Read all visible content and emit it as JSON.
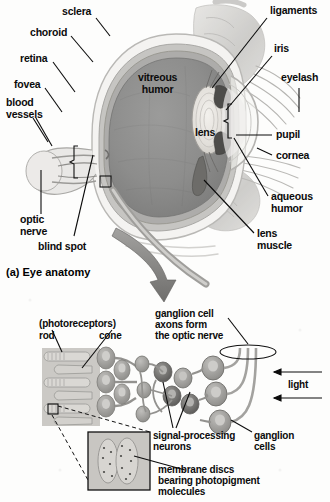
{
  "figure": {
    "caption_a": "(a) Eye anatomy",
    "background_color": "#fdfdfc",
    "ink_color": "#0b0b0b"
  },
  "eye_anatomy": {
    "labels": {
      "sclera": "sclera",
      "choroid": "choroid",
      "retina": "retina",
      "fovea": "fovea",
      "blood_vessels": "blood\nvessels",
      "optic_nerve": "optic\nnerve",
      "blind_spot": "blind spot",
      "vitreous_humor": "vitreous\nhumor",
      "lens": "lens",
      "ligaments": "ligaments",
      "iris": "iris",
      "eyelash": "eyelash",
      "pupil": "pupil",
      "cornea": "cornea",
      "aqueous_humor": "aqueous\nhumor",
      "lens_muscle": "lens\nmuscle"
    },
    "colors": {
      "vitreous": "#8d8d8d",
      "sclera": "#f2f1ef",
      "choroid": "#b9b8b6",
      "retina": "#a8a7a5",
      "lens": "#e6e4e0",
      "iris": "#4a4a4a",
      "eyelid": "#c9c8c5"
    }
  },
  "retina_diagram": {
    "labels": {
      "photoreceptors": "(photoreceptors)",
      "rod": "rod",
      "cone": "cone",
      "ganglion_axons": "ganglion cell\naxons form\nthe optic nerve",
      "light": "light",
      "ganglion_cells": "ganglion\ncells",
      "signal_processing": "signal-processing\nneurons",
      "membrane_discs": "membrane discs\nbearing photopigment\nmolecules"
    },
    "colors": {
      "slab": "#cfcdc9",
      "cell_body": "#a6a5a2",
      "cell_dark": "#6e6d6b",
      "inset_bg": "#c4c2be",
      "arrow": "#8a8986"
    }
  }
}
